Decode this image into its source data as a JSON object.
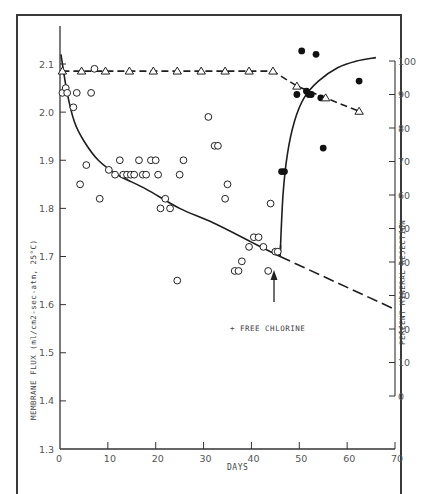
{
  "chart_data": {
    "type": "scatter",
    "title": "",
    "xlabel": "DAYS",
    "ylabel": "MEMBRANE FLUX (ml/cm2-sec-atm, 25°C)",
    "y2label": "PERCENT MINERAL REJECTION",
    "xlim": [
      0,
      70
    ],
    "ylim": [
      1.3,
      2.15
    ],
    "y2lim": [
      0,
      100
    ],
    "x_ticks": [
      "0",
      "10",
      "20",
      "30",
      "40",
      "50",
      "60",
      "70"
    ],
    "y_ticks": [
      "1.3",
      "1.4",
      "1.5",
      "1.6",
      "1.7",
      "1.8",
      "1.9",
      "2.0",
      "2.1"
    ],
    "y2_ticks": [
      "0",
      "10",
      "20",
      "30",
      "40",
      "50",
      "60",
      "70",
      "80",
      "90",
      "100"
    ],
    "grid": false,
    "annotation": {
      "text": "+ FREE CHLORINE",
      "x_day": 46
    },
    "series": [
      {
        "name": "Membrane flux (before chlorine)",
        "marker": "open-circle",
        "axis": "left",
        "points": [
          [
            0.5,
            2.04
          ],
          [
            1.2,
            2.05
          ],
          [
            1.5,
            2.04
          ],
          [
            2.8,
            2.01
          ],
          [
            3.5,
            2.04
          ],
          [
            4.2,
            1.85
          ],
          [
            5.5,
            1.89
          ],
          [
            6.5,
            2.04
          ],
          [
            7.2,
            2.09
          ],
          [
            8.3,
            1.82
          ],
          [
            10.2,
            1.88
          ],
          [
            11.5,
            1.87
          ],
          [
            12.5,
            1.9
          ],
          [
            13.2,
            1.87
          ],
          [
            14.0,
            1.87
          ],
          [
            14.8,
            1.87
          ],
          [
            15.5,
            1.87
          ],
          [
            16.5,
            1.9
          ],
          [
            17.3,
            1.87
          ],
          [
            18.0,
            1.87
          ],
          [
            19.0,
            1.9
          ],
          [
            20.0,
            1.9
          ],
          [
            20.5,
            1.87
          ],
          [
            21.0,
            1.8
          ],
          [
            22.0,
            1.82
          ],
          [
            23.0,
            1.8
          ],
          [
            24.5,
            1.65
          ],
          [
            25.0,
            1.87
          ],
          [
            25.8,
            1.9
          ],
          [
            31.0,
            1.99
          ],
          [
            32.3,
            1.93
          ],
          [
            33.0,
            1.93
          ],
          [
            34.5,
            1.82
          ],
          [
            35.0,
            1.85
          ],
          [
            36.5,
            1.67
          ],
          [
            37.3,
            1.67
          ],
          [
            38.0,
            1.69
          ],
          [
            39.5,
            1.72
          ],
          [
            40.5,
            1.74
          ],
          [
            41.5,
            1.74
          ],
          [
            42.5,
            1.72
          ],
          [
            43.5,
            1.67
          ],
          [
            44.0,
            1.81
          ],
          [
            45.0,
            1.71
          ],
          [
            45.5,
            1.71
          ]
        ]
      },
      {
        "name": "Mineral rejection (after chlorine)",
        "marker": "filled-circle",
        "axis": "right",
        "points": [
          [
            46.3,
            67
          ],
          [
            46.9,
            67
          ],
          [
            49.5,
            90
          ],
          [
            50.5,
            103
          ],
          [
            51.5,
            91
          ],
          [
            52.0,
            90
          ],
          [
            52.5,
            90
          ],
          [
            53.5,
            102
          ],
          [
            54.5,
            89
          ],
          [
            55.0,
            74
          ],
          [
            62.5,
            94
          ]
        ]
      },
      {
        "name": "Mineral rejection",
        "marker": "open-triangle",
        "axis": "right",
        "line": "dashed",
        "points": [
          [
            0.5,
            97
          ],
          [
            4.5,
            97
          ],
          [
            9.5,
            97
          ],
          [
            14.5,
            97
          ],
          [
            19.5,
            97
          ],
          [
            24.5,
            97
          ],
          [
            29.5,
            97
          ],
          [
            34.5,
            97
          ],
          [
            39.5,
            97
          ],
          [
            44.5,
            97
          ],
          [
            49.5,
            92.5
          ],
          [
            55.5,
            89
          ],
          [
            62.5,
            85
          ]
        ]
      },
      {
        "name": "Flux trend (solid)",
        "line": "solid",
        "axis": "left",
        "points": [
          [
            0.2,
            2.12
          ],
          [
            1.5,
            2.04
          ],
          [
            3,
            1.98
          ],
          [
            5,
            1.94
          ],
          [
            8,
            1.9
          ],
          [
            12,
            1.87
          ],
          [
            18,
            1.84
          ],
          [
            25,
            1.8
          ],
          [
            32,
            1.77
          ],
          [
            40,
            1.73
          ],
          [
            46,
            1.7
          ]
        ]
      },
      {
        "name": "Flux trend (extrapolated, dashed)",
        "line": "dashed",
        "axis": "left",
        "points": [
          [
            46,
            1.7
          ],
          [
            70,
            1.59
          ]
        ]
      },
      {
        "name": "Rejection recovery curve",
        "line": "solid",
        "axis": "right",
        "points": [
          [
            46,
            42
          ],
          [
            46.6,
            60
          ],
          [
            47.5,
            72
          ],
          [
            49,
            82
          ],
          [
            51,
            89
          ],
          [
            54,
            94
          ],
          [
            58,
            98
          ],
          [
            62,
            100
          ],
          [
            66,
            101
          ]
        ]
      }
    ]
  }
}
